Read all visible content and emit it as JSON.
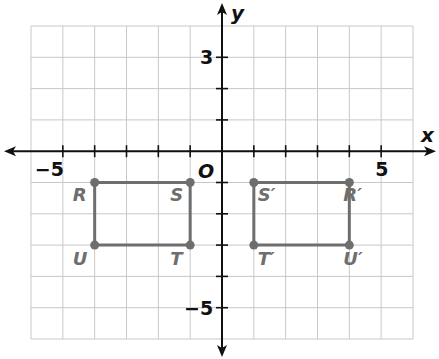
{
  "diagram": {
    "type": "coordinate-plane",
    "x_axis_label": "x",
    "y_axis_label": "y",
    "origin_label": "O",
    "x_range": [
      -6,
      6
    ],
    "y_range": [
      -6,
      4
    ],
    "tick_labels": [
      {
        "axis": "x",
        "value": -5,
        "text": "−5"
      },
      {
        "axis": "x",
        "value": 5,
        "text": "5"
      },
      {
        "axis": "y",
        "value": 3,
        "text": "3"
      },
      {
        "axis": "y",
        "value": -5,
        "text": "−5"
      }
    ],
    "colors": {
      "grid": "#c8c8c8",
      "axis": "#111111",
      "shape": "#6e6e6e",
      "label_dark": "#111111",
      "label_gray": "#6e6e6e"
    },
    "shapes": [
      {
        "name": "RSTU",
        "vertices": [
          {
            "label": "R",
            "x": -4,
            "y": -1
          },
          {
            "label": "S",
            "x": -1,
            "y": -1
          },
          {
            "label": "T",
            "x": -1,
            "y": -3
          },
          {
            "label": "U",
            "x": -4,
            "y": -3
          }
        ]
      },
      {
        "name": "R'S'T'U'",
        "vertices": [
          {
            "label": "R′",
            "x": 4,
            "y": -1
          },
          {
            "label": "S′",
            "x": 1,
            "y": -1
          },
          {
            "label": "T′",
            "x": 1,
            "y": -3
          },
          {
            "label": "U′",
            "x": 4,
            "y": -3
          }
        ]
      }
    ]
  }
}
